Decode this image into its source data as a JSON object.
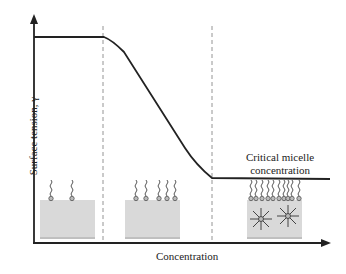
{
  "diagram": {
    "title": "",
    "x_axis_label": "Concentration",
    "y_axis_label": "Surface tension, γ",
    "annotation": {
      "line1": "Critical micelle",
      "line2": "concentration"
    },
    "regions": [
      {
        "name": "low-concentration",
        "surfactants_at_surface": 2,
        "micelles": 0
      },
      {
        "name": "intermediate-concentration",
        "surfactants_at_surface": 5,
        "micelles": 0
      },
      {
        "name": "above-cmc",
        "surfactants_at_surface": 10,
        "micelles": 2
      }
    ],
    "colors": {
      "line": "#222222",
      "dashed": "#888888",
      "box": "#d9d9d9"
    }
  }
}
